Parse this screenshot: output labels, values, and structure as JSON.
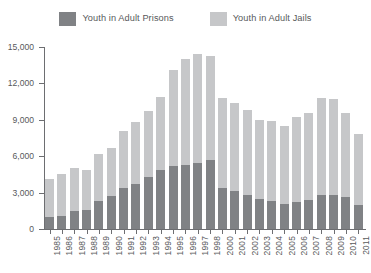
{
  "legend": {
    "entries": [
      {
        "label": "Youth in Adult Prisons",
        "color": "#808285",
        "icon": "legend-swatch-prisons"
      },
      {
        "label": "Youth in Adult Jails",
        "color": "#c6c7c9",
        "icon": "legend-swatch-jails"
      }
    ]
  },
  "chart_data": {
    "type": "bar",
    "title": "",
    "subtitle": "",
    "xlabel": "",
    "ylabel": "",
    "stacked": true,
    "grid": false,
    "legend_position": "top-center",
    "ylim": [
      0,
      15000
    ],
    "yticks": [
      0,
      3000,
      6000,
      9000,
      12000,
      15000
    ],
    "ytick_labels": [
      "0",
      "3,000",
      "6,000",
      "9,000",
      "12,000",
      "15,000"
    ],
    "categories": [
      "1985",
      "1986",
      "1987",
      "1988",
      "1989",
      "1990",
      "1991",
      "1992",
      "1993",
      "1994",
      "1995",
      "1996",
      "1997",
      "1998",
      "2000",
      "2001",
      "2002",
      "2003",
      "2004",
      "2005",
      "2006",
      "2007",
      "2008",
      "2009",
      "2010",
      "2011"
    ],
    "series": [
      {
        "name": "Youth in Adult Prisons",
        "color": "#808285",
        "values": [
          1000,
          1100,
          1500,
          1600,
          2300,
          2700,
          3400,
          3700,
          4300,
          4900,
          5200,
          5300,
          5400,
          5700,
          3400,
          3100,
          2800,
          2500,
          2300,
          2100,
          2200,
          2400,
          2800,
          2800,
          2600,
          2000
        ]
      },
      {
        "name": "Youth in Adult Jails",
        "color": "#c6c7c9",
        "values": [
          3100,
          3400,
          3500,
          3300,
          3900,
          4000,
          4700,
          5100,
          5400,
          6000,
          7900,
          8700,
          9000,
          8600,
          7400,
          7300,
          7000,
          6500,
          6600,
          6400,
          7000,
          7200,
          8000,
          7900,
          7000,
          5800
        ]
      }
    ],
    "totals": [
      4100,
      4500,
      5000,
      4900,
      6200,
      6700,
      8100,
      8800,
      9700,
      10900,
      13100,
      14000,
      14400,
      14300,
      10800,
      10400,
      9800,
      9000,
      8900,
      8500,
      9200,
      9600,
      10800,
      10700,
      9600,
      7800
    ]
  }
}
